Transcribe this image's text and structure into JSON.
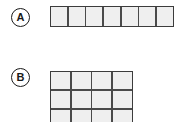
{
  "page": {
    "background_color": "#ffffff",
    "width": 179,
    "height": 122
  },
  "style": {
    "cell_fill_color": "#efefef",
    "grid_line_color": "#4a4a4a",
    "border_color": "#3c3c3c",
    "label_text_color": "#1a1a1a"
  },
  "items": [
    {
      "id": "a",
      "label": "A",
      "shape": "single-row-strip",
      "columns": 7,
      "rows": 1,
      "cell_count": 7,
      "clipped": false
    },
    {
      "id": "b",
      "label": "B",
      "shape": "rectangular-array",
      "columns": 4,
      "rows": 4,
      "visible_rows": 3,
      "cell_count": 16,
      "clipped": true,
      "clip_note": "bottom rows cut off by image edge"
    }
  ],
  "chart_data": {
    "type": "table",
    "title": "",
    "categories": [
      "A",
      "B"
    ],
    "series": [
      {
        "name": "columns",
        "values": [
          7,
          4
        ]
      },
      {
        "name": "rows",
        "values": [
          1,
          4
        ]
      },
      {
        "name": "cells",
        "values": [
          7,
          16
        ]
      }
    ]
  }
}
